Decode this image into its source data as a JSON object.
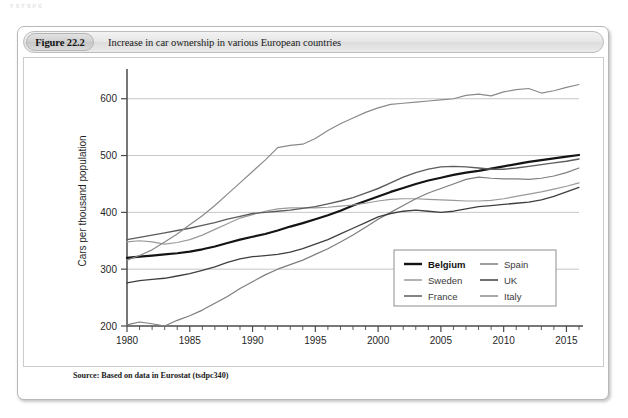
{
  "bleed": {
    "line1": "y                                                                                                              g        y  g                       p      g",
    "line2": "                                                                                                                                                      "
  },
  "figure": {
    "number_label": "Figure 22.2",
    "caption": "Increase in car ownership in various European countries",
    "source": "Source: Based on data in Eurostat (tsdpc340)"
  },
  "legend": {
    "position": "inside-bottom-right",
    "entries": [
      {
        "label": "Belgium",
        "color": "#141414",
        "width": 2.2,
        "bold": true
      },
      {
        "label": "Sweden",
        "color": "#9a9a9a",
        "width": 1.2,
        "bold": false
      },
      {
        "label": "France",
        "color": "#5d5d5d",
        "width": 1.4,
        "bold": false
      },
      {
        "label": "Spain",
        "color": "#7d7d7d",
        "width": 1.2,
        "bold": false
      },
      {
        "label": "UK",
        "color": "#3f3f3f",
        "width": 1.3,
        "bold": false
      },
      {
        "label": "Italy",
        "color": "#8a8a8a",
        "width": 1.2,
        "bold": false
      }
    ]
  },
  "chart_data": {
    "type": "line",
    "title": "Increase in car ownership in various European countries",
    "xlabel": "",
    "ylabel": "Cars per thousand population",
    "xlim": [
      1980,
      2016
    ],
    "ylim": [
      200,
      640
    ],
    "yticks": [
      200,
      300,
      400,
      500,
      600
    ],
    "xticks_major": [
      1980,
      1985,
      1990,
      1995,
      2000,
      2005,
      2010,
      2015
    ],
    "xtick_minor_step": 1,
    "grid": "horizontal-only",
    "x": [
      1980,
      1981,
      1982,
      1983,
      1984,
      1985,
      1986,
      1987,
      1988,
      1989,
      1990,
      1991,
      1992,
      1993,
      1994,
      1995,
      1996,
      1997,
      1998,
      1999,
      2000,
      2001,
      2002,
      2003,
      2004,
      2005,
      2006,
      2007,
      2008,
      2009,
      2010,
      2011,
      2012,
      2013,
      2014,
      2015,
      2016
    ],
    "series": [
      {
        "name": "Belgium",
        "color": "#141414",
        "values": [
          320,
          322,
          324,
          326,
          328,
          331,
          335,
          340,
          346,
          352,
          357,
          362,
          368,
          375,
          381,
          388,
          395,
          403,
          412,
          420,
          428,
          436,
          443,
          450,
          456,
          461,
          466,
          470,
          473,
          477,
          481,
          485,
          489,
          492,
          495,
          498,
          501
        ]
      },
      {
        "name": "Sweden",
        "color": "#9a9a9a",
        "values": [
          348,
          350,
          348,
          344,
          347,
          352,
          360,
          370,
          380,
          390,
          396,
          402,
          406,
          408,
          408,
          408,
          409,
          411,
          413,
          416,
          420,
          423,
          424,
          424,
          423,
          422,
          421,
          420,
          420,
          421,
          424,
          428,
          432,
          436,
          441,
          446,
          452
        ]
      },
      {
        "name": "France",
        "color": "#5d5d5d",
        "values": [
          352,
          356,
          360,
          364,
          368,
          372,
          377,
          382,
          388,
          393,
          398,
          400,
          402,
          404,
          407,
          410,
          415,
          420,
          426,
          434,
          442,
          452,
          462,
          470,
          476,
          480,
          481,
          480,
          478,
          476,
          476,
          478,
          481,
          484,
          487,
          490,
          494
        ]
      },
      {
        "name": "Spain",
        "color": "#7d7d7d",
        "values": [
          202,
          207,
          204,
          200,
          210,
          218,
          228,
          240,
          252,
          266,
          278,
          290,
          300,
          308,
          316,
          326,
          336,
          348,
          360,
          374,
          388,
          400,
          412,
          424,
          434,
          442,
          450,
          458,
          462,
          460,
          459,
          459,
          458,
          460,
          464,
          470,
          478
        ]
      },
      {
        "name": "UK",
        "color": "#3f3f3f",
        "values": [
          276,
          280,
          282,
          284,
          288,
          292,
          298,
          304,
          312,
          318,
          322,
          324,
          326,
          330,
          336,
          344,
          352,
          362,
          372,
          382,
          392,
          398,
          402,
          404,
          402,
          400,
          402,
          406,
          410,
          412,
          414,
          416,
          418,
          422,
          428,
          436,
          444
        ]
      },
      {
        "name": "Italy",
        "color": "#8a8a8a",
        "values": [
          316,
          324,
          334,
          348,
          362,
          378,
          394,
          412,
          432,
          452,
          472,
          492,
          514,
          518,
          520,
          530,
          544,
          556,
          566,
          576,
          584,
          590,
          592,
          594,
          596,
          598,
          600,
          606,
          608,
          605,
          612,
          616,
          618,
          610,
          614,
          620,
          625
        ]
      }
    ]
  },
  "axis": {
    "y_title": "Cars per thousand population",
    "y_tick_labels": [
      "200",
      "300",
      "400",
      "500",
      "600"
    ],
    "x_tick_labels": [
      "1980",
      "1985",
      "1990",
      "1995",
      "2000",
      "2005",
      "2010",
      "2015"
    ]
  }
}
